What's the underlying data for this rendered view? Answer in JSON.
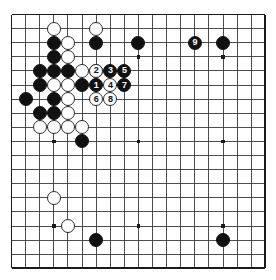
{
  "board": {
    "type": "go-board",
    "size": 19,
    "origin_x": 11.5,
    "origin_y": 14.5,
    "spacing": 14.1,
    "stone_radius": 7.0,
    "line_color": "#3a3a3a",
    "border_color": "#1a1a1a",
    "background_color": "#ffffff",
    "black_color": "#111111",
    "white_color": "#ffffff",
    "star_points": [
      [
        3,
        3
      ],
      [
        9,
        3
      ],
      [
        15,
        3
      ],
      [
        3,
        9
      ],
      [
        9,
        9
      ],
      [
        15,
        9
      ],
      [
        3,
        15
      ],
      [
        9,
        15
      ],
      [
        15,
        15
      ]
    ]
  },
  "stones": [
    {
      "name": "white-stone",
      "color": "white",
      "col": 3,
      "row": 1,
      "label": ""
    },
    {
      "name": "white-stone",
      "color": "white",
      "col": 6,
      "row": 1,
      "label": ""
    },
    {
      "name": "black-stone",
      "color": "black",
      "col": 3,
      "row": 2,
      "label": ""
    },
    {
      "name": "white-stone",
      "color": "white",
      "col": 4,
      "row": 2,
      "label": ""
    },
    {
      "name": "black-stone",
      "color": "black",
      "col": 6,
      "row": 2,
      "label": ""
    },
    {
      "name": "black-stone",
      "color": "black",
      "col": 9,
      "row": 2,
      "label": ""
    },
    {
      "name": "black-stone",
      "color": "black",
      "col": 3,
      "row": 3,
      "label": ""
    },
    {
      "name": "white-stone",
      "color": "white",
      "col": 4,
      "row": 3,
      "label": ""
    },
    {
      "name": "black-stone",
      "color": "black",
      "col": 2,
      "row": 4,
      "label": ""
    },
    {
      "name": "black-stone",
      "color": "black",
      "col": 3,
      "row": 4,
      "label": ""
    },
    {
      "name": "black-stone",
      "color": "black",
      "col": 4,
      "row": 4,
      "label": ""
    },
    {
      "name": "white-stone",
      "color": "white",
      "col": 5,
      "row": 4,
      "label": ""
    },
    {
      "name": "white-stone",
      "color": "white",
      "col": 6,
      "row": 4,
      "label": ""
    },
    {
      "name": "black-stone",
      "color": "black",
      "col": 2,
      "row": 5,
      "label": ""
    },
    {
      "name": "white-stone",
      "color": "white",
      "col": 3,
      "row": 5,
      "label": ""
    },
    {
      "name": "white-stone",
      "color": "white",
      "col": 4,
      "row": 5,
      "label": ""
    },
    {
      "name": "black-stone",
      "color": "black",
      "col": 5,
      "row": 5,
      "label": ""
    },
    {
      "name": "black-stone",
      "color": "black",
      "col": 1,
      "row": 6,
      "label": ""
    },
    {
      "name": "black-stone",
      "color": "black",
      "col": 3,
      "row": 6,
      "label": ""
    },
    {
      "name": "white-stone",
      "color": "white",
      "col": 4,
      "row": 6,
      "label": ""
    },
    {
      "name": "black-stone",
      "color": "black",
      "col": 2,
      "row": 7,
      "label": ""
    },
    {
      "name": "black-stone",
      "color": "black",
      "col": 3,
      "row": 7,
      "label": ""
    },
    {
      "name": "white-stone",
      "color": "white",
      "col": 4,
      "row": 7,
      "label": ""
    },
    {
      "name": "white-stone",
      "color": "white",
      "col": 2,
      "row": 8,
      "label": ""
    },
    {
      "name": "white-stone",
      "color": "white",
      "col": 3,
      "row": 8,
      "label": ""
    },
    {
      "name": "white-stone",
      "color": "white",
      "col": 4,
      "row": 8,
      "label": ""
    },
    {
      "name": "white-stone",
      "color": "white",
      "col": 5,
      "row": 8,
      "label": ""
    },
    {
      "name": "black-stone",
      "color": "black",
      "col": 5,
      "row": 9,
      "label": ""
    },
    {
      "name": "white-stone",
      "color": "white",
      "col": 3,
      "row": 13,
      "label": ""
    },
    {
      "name": "white-stone",
      "color": "white",
      "col": 4,
      "row": 15,
      "label": ""
    },
    {
      "name": "black-stone",
      "color": "black",
      "col": 6,
      "row": 16,
      "label": ""
    },
    {
      "name": "black-stone",
      "color": "black",
      "col": 15,
      "row": 16,
      "label": ""
    },
    {
      "name": "black-stone",
      "color": "black",
      "col": 15,
      "row": 2,
      "label": ""
    },
    {
      "name": "numbered-stone-1",
      "color": "black",
      "col": 6,
      "row": 5,
      "label": "1"
    },
    {
      "name": "numbered-stone-2",
      "color": "white",
      "col": 6,
      "row": 4,
      "label": "2"
    },
    {
      "name": "numbered-stone-3",
      "color": "black",
      "col": 7,
      "row": 4,
      "label": "3"
    },
    {
      "name": "numbered-stone-4",
      "color": "white",
      "col": 7,
      "row": 5,
      "label": "4"
    },
    {
      "name": "numbered-stone-5",
      "color": "black",
      "col": 8,
      "row": 4,
      "label": "5"
    },
    {
      "name": "numbered-stone-6",
      "color": "white",
      "col": 6,
      "row": 6,
      "label": "6"
    },
    {
      "name": "numbered-stone-7",
      "color": "black",
      "col": 8,
      "row": 5,
      "label": "7"
    },
    {
      "name": "numbered-stone-8",
      "color": "white",
      "col": 7,
      "row": 6,
      "label": "8"
    },
    {
      "name": "numbered-stone-9",
      "color": "black",
      "col": 13,
      "row": 2,
      "label": "9"
    }
  ]
}
